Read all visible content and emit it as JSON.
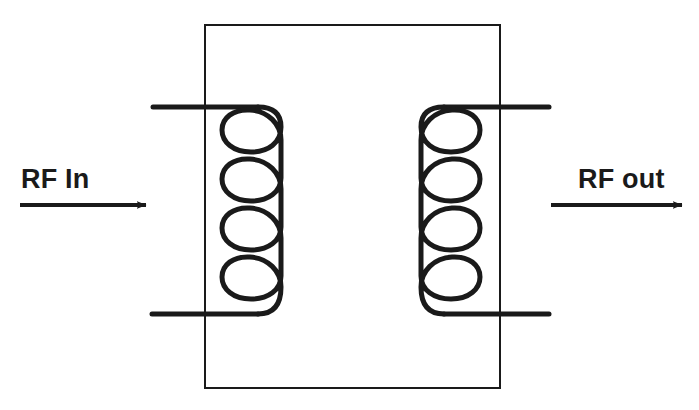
{
  "diagram": {
    "type": "schematic-diagram",
    "background_color": "#ffffff",
    "stroke_color": "#1a1a1a",
    "core": {
      "shape": "rectangle",
      "x": 205,
      "y": 25,
      "width": 295,
      "height": 363,
      "stroke_width": 2,
      "fill": "none"
    },
    "labels": {
      "input": "RF In",
      "output": "RF out"
    },
    "arrows": {
      "input": {
        "name": "rf-in-arrow",
        "direction": "right",
        "x1": 20,
        "x2": 146,
        "y": 205
      },
      "output": {
        "name": "rf-out-arrow",
        "direction": "right",
        "x1": 551,
        "x2": 682,
        "y": 205
      }
    },
    "coils": [
      {
        "name": "primary-coil",
        "side": "left",
        "turns": 5,
        "cx": 250,
        "top_y": 107,
        "bottom_y": 314,
        "loop_width": 56,
        "mirrored": false
      },
      {
        "name": "secondary-coil",
        "side": "right",
        "turns": 5,
        "cx": 452,
        "top_y": 107,
        "bottom_y": 314,
        "loop_width": 56,
        "mirrored": true
      }
    ],
    "leads": [
      {
        "name": "primary-top-lead",
        "x1": 153,
        "x2": 232,
        "y": 107
      },
      {
        "name": "primary-bottom-lead",
        "x1": 152,
        "x2": 232,
        "y": 314
      },
      {
        "name": "secondary-top-lead",
        "x1": 470,
        "x2": 549,
        "y": 107
      },
      {
        "name": "secondary-bottom-lead",
        "x1": 470,
        "x2": 549,
        "y": 314
      }
    ]
  }
}
